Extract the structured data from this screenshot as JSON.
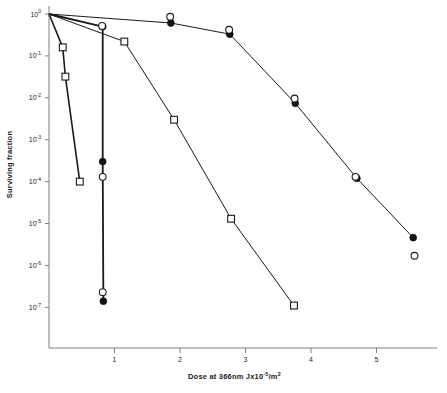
{
  "chart_data": {
    "type": "line",
    "title": "",
    "xlabel": "Dose at 366nm Jx10-5/m2",
    "xlabel_parts": {
      "pre": "Dose at 366nm Jx10",
      "sup1": "-5",
      "mid": "/m",
      "sup2": "2"
    },
    "ylabel": "Surviving fraction",
    "xlim": [
      0,
      5.9
    ],
    "ylim_log": [
      -7.6,
      0.1
    ],
    "xticks": [
      1,
      2,
      3,
      4,
      5
    ],
    "xtick_labels": [
      "1",
      "2",
      "3",
      "4",
      "5"
    ],
    "yticks_exp": [
      0,
      -1,
      -2,
      -3,
      -4,
      -5,
      -6,
      -7
    ],
    "ytick_labels": [
      "10",
      "10",
      "10",
      "10",
      "10",
      "10",
      "10",
      "10"
    ],
    "ytick_exponents": [
      "0",
      "-1",
      "-2",
      "-3",
      "-4",
      "-5",
      "-6",
      "-7"
    ],
    "grid": false,
    "legend": "none",
    "yscale": "log",
    "series": [
      {
        "name": "steep-open-square",
        "marker": "open-square",
        "line_width": 1.6,
        "points": [
          {
            "x": 0.0,
            "y": 1.0
          },
          {
            "x": 0.21,
            "y": 0.16
          },
          {
            "x": 0.25,
            "y": 0.032
          },
          {
            "x": 0.47,
            "y": 0.0001
          }
        ]
      },
      {
        "name": "steep-filled-circle",
        "marker": "filled-circle",
        "line_width": 1.8,
        "points": [
          {
            "x": 0.0,
            "y": 1.0
          },
          {
            "x": 0.82,
            "y": 0.5
          },
          {
            "x": 0.82,
            "y": 0.0003
          },
          {
            "x": 0.83,
            "y": 1.4e-07
          }
        ]
      },
      {
        "name": "steep-open-circle",
        "marker": "open-circle",
        "line_width": 0,
        "points": [
          {
            "x": 0.81,
            "y": 0.52
          },
          {
            "x": 0.82,
            "y": 0.00013
          },
          {
            "x": 0.82,
            "y": 2.3e-07
          }
        ]
      },
      {
        "name": "mid-open-square",
        "marker": "open-square",
        "line_width": 1.0,
        "points": [
          {
            "x": 0.0,
            "y": 1.0
          },
          {
            "x": 1.15,
            "y": 0.22
          },
          {
            "x": 1.91,
            "y": 0.003
          },
          {
            "x": 2.78,
            "y": 1.3e-05
          },
          {
            "x": 3.74,
            "y": 1.1e-07
          }
        ]
      },
      {
        "name": "shallow-filled-circle",
        "marker": "filled-circle",
        "line_width": 1.0,
        "points": [
          {
            "x": 0.0,
            "y": 1.0
          },
          {
            "x": 1.86,
            "y": 0.61
          },
          {
            "x": 2.76,
            "y": 0.33
          },
          {
            "x": 3.76,
            "y": 0.0074
          },
          {
            "x": 4.7,
            "y": 0.00012
          },
          {
            "x": 5.56,
            "y": 4.6e-06
          }
        ]
      },
      {
        "name": "shallow-open-circle",
        "marker": "open-circle",
        "line_width": 0,
        "points": [
          {
            "x": 1.85,
            "y": 0.86
          },
          {
            "x": 2.75,
            "y": 0.42
          },
          {
            "x": 3.75,
            "y": 0.0096
          },
          {
            "x": 4.68,
            "y": 0.00013
          },
          {
            "x": 5.58,
            "y": 1.7e-06
          }
        ]
      }
    ]
  },
  "colors": {
    "axis": "#808080",
    "line": "#1a1a1a",
    "marker_fill": "#111111",
    "marker_open": "#ffffff",
    "text": "#1a1a1a",
    "background": "#ffffff"
  }
}
